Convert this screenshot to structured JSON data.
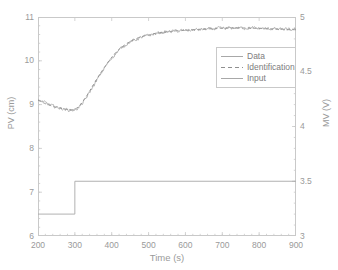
{
  "figure": {
    "background": "#ffffff",
    "axis_color": "#c9c9c9",
    "text_color": "#9a9a9a"
  },
  "chart_data": {
    "type": "line",
    "title": "",
    "xlabel": "Time (s)",
    "ylabel": "PV (cm)",
    "ylabel_right": "MV (V)",
    "xlim": [
      200,
      900
    ],
    "ylim": [
      6,
      11
    ],
    "ylim_right": [
      3,
      5
    ],
    "xticks": [
      200,
      300,
      400,
      500,
      600,
      700,
      800,
      900
    ],
    "yticks": [
      6,
      7,
      8,
      9,
      10,
      11
    ],
    "yticks_right": [
      3,
      3.5,
      4,
      4.5,
      5
    ],
    "xtick_labels": [
      "200",
      "300",
      "400",
      "500",
      "600",
      "700",
      "800",
      "900"
    ],
    "ytick_labels": [
      "6",
      "7",
      "8",
      "9",
      "10",
      "11"
    ],
    "ytick_labels_right": [
      "3",
      "3.5",
      "4",
      "4.5",
      "5"
    ],
    "grid": false,
    "legend_position": "upper right inside",
    "legend": [
      "Data",
      "Identification",
      "Input"
    ],
    "series": [
      {
        "name": "Data",
        "axis": "left",
        "style": "solid",
        "color": "#a8a8a8",
        "noise_amplitude": 0.055,
        "comment": "Noisy measured process variable, cm",
        "x": [
          200,
          210,
          220,
          230,
          240,
          250,
          260,
          270,
          280,
          290,
          300,
          310,
          320,
          330,
          340,
          350,
          360,
          370,
          380,
          390,
          400,
          410,
          420,
          430,
          440,
          450,
          460,
          470,
          480,
          490,
          500,
          510,
          520,
          530,
          540,
          550,
          560,
          570,
          580,
          590,
          600,
          610,
          620,
          630,
          640,
          650,
          660,
          670,
          680,
          690,
          700,
          710,
          720,
          730,
          740,
          750,
          760,
          770,
          780,
          790,
          800,
          810,
          820,
          830,
          840,
          850,
          860,
          870,
          880,
          890,
          900
        ],
        "y": [
          9.12,
          9.08,
          9.04,
          9.0,
          8.97,
          8.94,
          8.92,
          8.9,
          8.88,
          8.87,
          8.88,
          8.93,
          9.02,
          9.14,
          9.28,
          9.42,
          9.56,
          9.7,
          9.83,
          9.95,
          10.06,
          10.16,
          10.25,
          10.32,
          10.38,
          10.43,
          10.47,
          10.5,
          10.53,
          10.56,
          10.58,
          10.6,
          10.62,
          10.64,
          10.65,
          10.66,
          10.67,
          10.68,
          10.68,
          10.69,
          10.69,
          10.7,
          10.7,
          10.71,
          10.71,
          10.72,
          10.72,
          10.73,
          10.73,
          10.74,
          10.74,
          10.74,
          10.75,
          10.75,
          10.75,
          10.75,
          10.75,
          10.75,
          10.75,
          10.74,
          10.74,
          10.74,
          10.73,
          10.73,
          10.73,
          10.72,
          10.72,
          10.72,
          10.71,
          10.71,
          10.71
        ]
      },
      {
        "name": "Identification",
        "axis": "left",
        "style": "dashed",
        "color": "#8f8f8f",
        "comment": "Model fit, first-order-plus-deadtime style step response, cm",
        "x": [
          200,
          210,
          220,
          230,
          240,
          250,
          260,
          270,
          280,
          290,
          300,
          310,
          320,
          330,
          340,
          350,
          360,
          370,
          380,
          390,
          400,
          410,
          420,
          430,
          440,
          450,
          460,
          470,
          480,
          490,
          500,
          510,
          520,
          530,
          540,
          550,
          560,
          570,
          580,
          590,
          600,
          610,
          620,
          630,
          640,
          650,
          660,
          670,
          680,
          690,
          700,
          710,
          720,
          730,
          740,
          750,
          760,
          770,
          780,
          790,
          800,
          810,
          820,
          830,
          840,
          850,
          860,
          870,
          880,
          890,
          900
        ],
        "y": [
          9.1,
          9.06,
          9.02,
          8.99,
          8.96,
          8.94,
          8.92,
          8.9,
          8.89,
          8.88,
          8.89,
          8.95,
          9.05,
          9.17,
          9.31,
          9.45,
          9.59,
          9.72,
          9.85,
          9.97,
          10.08,
          10.18,
          10.26,
          10.33,
          10.39,
          10.44,
          10.48,
          10.52,
          10.55,
          10.57,
          10.59,
          10.61,
          10.63,
          10.64,
          10.65,
          10.66,
          10.67,
          10.68,
          10.69,
          10.69,
          10.7,
          10.7,
          10.71,
          10.71,
          10.72,
          10.72,
          10.73,
          10.73,
          10.73,
          10.74,
          10.74,
          10.74,
          10.75,
          10.75,
          10.75,
          10.75,
          10.75,
          10.75,
          10.74,
          10.74,
          10.74,
          10.74,
          10.73,
          10.73,
          10.73,
          10.72,
          10.72,
          10.72,
          10.71,
          10.71,
          10.71
        ]
      },
      {
        "name": "Input",
        "axis": "right",
        "style": "solid",
        "color": "#a8a8a8",
        "comment": "Manipulated variable step, volts; step at t=300 s",
        "step_time": 300,
        "level_before": 3.2,
        "level_after": 3.5,
        "x": [
          200,
          300,
          300,
          900
        ],
        "y": [
          3.2,
          3.2,
          3.5,
          3.5
        ]
      }
    ]
  }
}
